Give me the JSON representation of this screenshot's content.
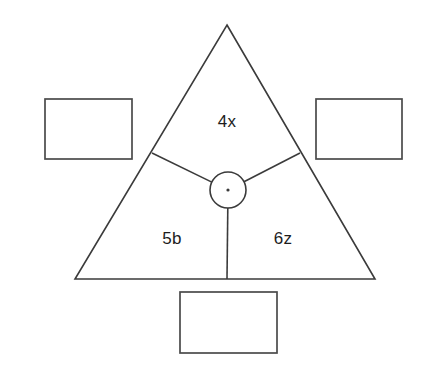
{
  "figure": {
    "type": "geometry-diagram",
    "background_color": "#ffffff",
    "stroke_color": "#3b3b3b",
    "text_color": "#1d1d1d",
    "box_stroke_color": "#4a4a4a"
  },
  "triangle": {
    "name": "outer-triangle",
    "apex": {
      "x": 227,
      "y": 25
    },
    "bottom_left": {
      "x": 75,
      "y": 279
    },
    "bottom_right": {
      "x": 375,
      "y": 279
    }
  },
  "center_point": {
    "name": "center-vertex",
    "x": 228,
    "y": 190,
    "radius": 18,
    "dot_radius": 1.6
  },
  "rays": [
    {
      "name": "ray-upper-left",
      "to_x": 152,
      "to_y": 153
    },
    {
      "name": "ray-upper-right",
      "to_x": 300,
      "to_y": 153
    },
    {
      "name": "ray-down",
      "to_x": 227,
      "to_y": 279
    }
  ],
  "sector_labels": [
    {
      "id": "top",
      "text": "4x",
      "x": 227,
      "y": 123
    },
    {
      "id": "bottom-left",
      "text": "5b",
      "x": 172,
      "y": 240
    },
    {
      "id": "bottom-right",
      "text": "6z",
      "x": 283,
      "y": 240
    }
  ],
  "answer_boxes": [
    {
      "id": "left",
      "value": "",
      "x": 45,
      "y": 99,
      "width": 87,
      "height": 60
    },
    {
      "id": "right",
      "value": "",
      "x": 316,
      "y": 99,
      "width": 86,
      "height": 60
    },
    {
      "id": "bottom",
      "value": "",
      "x": 180,
      "y": 292,
      "width": 97,
      "height": 61
    }
  ]
}
